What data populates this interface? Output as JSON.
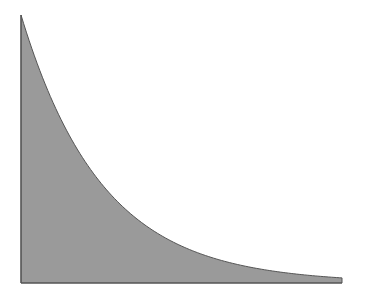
{
  "chart_data": {
    "type": "area",
    "title": "",
    "xlabel": "",
    "ylabel": "",
    "grid": false,
    "legend": null,
    "x": [
      0,
      0.1,
      0.2,
      0.3,
      0.4,
      0.5,
      0.6,
      0.7,
      0.8,
      0.9,
      1.0
    ],
    "values": [
      1.0,
      0.672,
      0.452,
      0.304,
      0.204,
      0.137,
      0.092,
      0.062,
      0.042,
      0.028,
      0.019
    ],
    "xlim": [
      0,
      1
    ],
    "ylim": [
      0,
      1
    ],
    "colors": {
      "fill": "#9a9a9a",
      "stroke": "#555555"
    }
  },
  "plot": {
    "left": 21,
    "right": 342,
    "top": 15,
    "bottom": 283
  }
}
